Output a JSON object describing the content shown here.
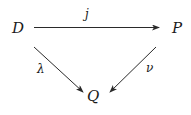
{
  "diagram": {
    "type": "commutative-triangle",
    "nodes": {
      "D": {
        "label": "D"
      },
      "P": {
        "label": "P"
      },
      "Q": {
        "label": "Q"
      }
    },
    "edges": [
      {
        "from": "D",
        "to": "P",
        "label": "j"
      },
      {
        "from": "D",
        "to": "Q",
        "label": "λ"
      },
      {
        "from": "P",
        "to": "Q",
        "label": "ν"
      }
    ]
  }
}
